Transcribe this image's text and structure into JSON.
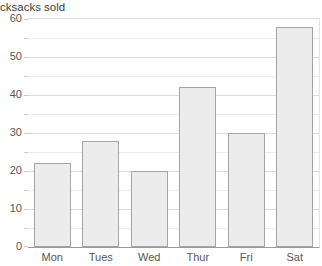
{
  "title": "cksacks sold",
  "colors": {
    "background": "#ffffff",
    "bar_fill": "#ececec",
    "bar_border": "#a5a5a5",
    "grid_major": "#dadada",
    "grid_minor": "#eaeaea",
    "axis_line": "#9b9b9b",
    "tick": "#c9c9c9",
    "label_text": "#565656",
    "title_text": "#3d3d3d"
  },
  "chart_data": {
    "type": "bar",
    "title": "cksacks sold",
    "categories": [
      "Mon",
      "Tues",
      "Wed",
      "Thur",
      "Fri",
      "Sat"
    ],
    "values": [
      22,
      28,
      20,
      42,
      30,
      58
    ],
    "xlabel": "",
    "ylabel": "",
    "ylim": [
      0,
      60
    ],
    "ytick_step": 10,
    "grid_step": 5,
    "yticks": [
      0,
      10,
      20,
      30,
      40,
      50,
      60
    ],
    "grid": "on",
    "legend": "none"
  }
}
